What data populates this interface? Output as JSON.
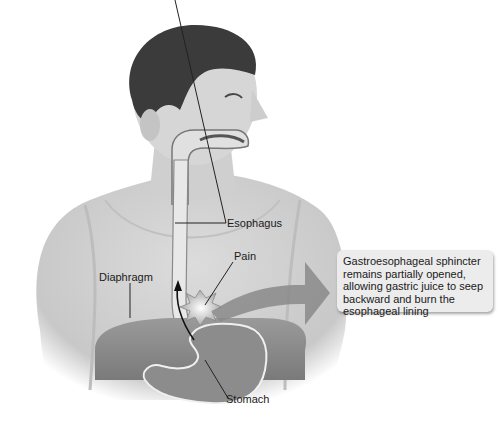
{
  "figure": {
    "labels": {
      "esophagus": "Esophagus",
      "pain": "Pain",
      "diaphragm": "Diaphragm",
      "stomach": "Stomach"
    },
    "callout": {
      "lines": [
        "Gastroesophageal sphincter",
        "remains partially opened,",
        "allowing gastric juice to seep",
        "backward and burn the",
        "esophageal lining"
      ]
    },
    "colors": {
      "arrow": "#8a8a8a",
      "callout_bg": "#ececec",
      "skin": "#d4d4d4",
      "hair": "#3a3a3a",
      "stomach": "#8c8c8c"
    }
  }
}
